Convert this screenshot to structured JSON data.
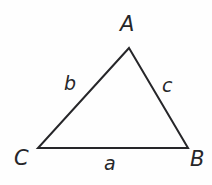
{
  "figure": {
    "name": "triangle-abc",
    "background_color": "#fefefe",
    "stroke_color": "#262629",
    "stroke_width": 2,
    "text_color": "#262629",
    "vertices": [
      {
        "id": "A",
        "label": "A",
        "x": 129,
        "y": 48
      },
      {
        "id": "B",
        "label": "B",
        "x": 188,
        "y": 148
      },
      {
        "id": "C",
        "label": "C",
        "x": 38,
        "y": 148
      }
    ],
    "vertex_labels": {
      "a": "A",
      "b": "B",
      "c": "C"
    },
    "side_labels": {
      "a": "a",
      "b": "b",
      "c": "c"
    },
    "sides": [
      {
        "id": "a",
        "label": "a",
        "from": "C",
        "to": "B",
        "position": "bottom"
      },
      {
        "id": "b",
        "label": "b",
        "from": "C",
        "to": "A",
        "position": "left"
      },
      {
        "id": "c",
        "label": "c",
        "from": "A",
        "to": "B",
        "position": "right"
      }
    ],
    "polygon_points": "129,48 188,148 38,148"
  }
}
